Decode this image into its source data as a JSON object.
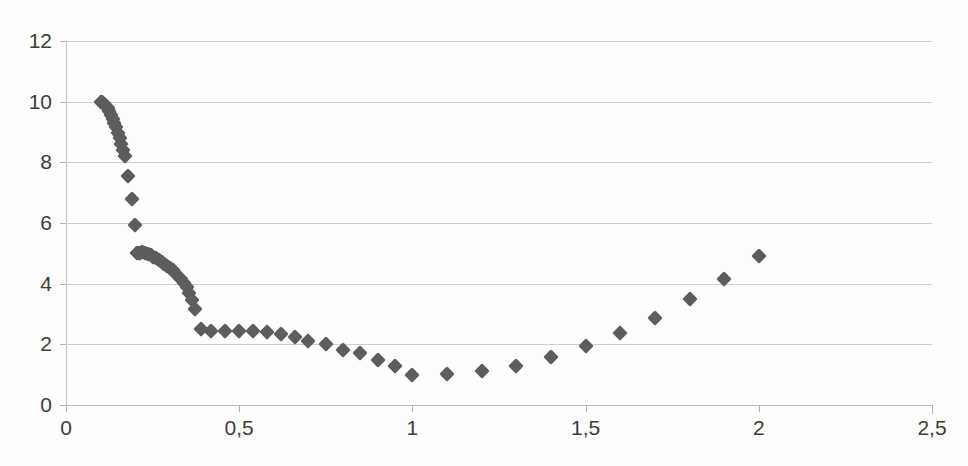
{
  "chart_data": {
    "type": "scatter",
    "title": "",
    "xlabel": "",
    "ylabel": "",
    "xlim": [
      0,
      2.5
    ],
    "ylim": [
      0,
      12
    ],
    "grid": true,
    "legend": null,
    "marker": {
      "shape": "diamond",
      "color": "#5d5d5d",
      "size": 11
    },
    "decimal_separator": ",",
    "xticks": [
      0,
      0.5,
      1,
      1.5,
      2,
      2.5
    ],
    "xtick_labels": [
      "0",
      "0,5",
      "1",
      "1,5",
      "2",
      "2,5"
    ],
    "yticks": [
      0,
      2,
      4,
      6,
      8,
      10,
      12
    ],
    "ytick_labels": [
      "0",
      "2",
      "4",
      "6",
      "8",
      "10",
      "12"
    ],
    "series": [
      {
        "name": "series-1",
        "points": [
          [
            0.1,
            10.0
          ],
          [
            0.105,
            9.98
          ],
          [
            0.11,
            9.92
          ],
          [
            0.115,
            9.85
          ],
          [
            0.12,
            9.78
          ],
          [
            0.125,
            9.68
          ],
          [
            0.13,
            9.55
          ],
          [
            0.135,
            9.44
          ],
          [
            0.14,
            9.3
          ],
          [
            0.145,
            9.15
          ],
          [
            0.15,
            8.98
          ],
          [
            0.155,
            8.8
          ],
          [
            0.16,
            8.62
          ],
          [
            0.165,
            8.4
          ],
          [
            0.17,
            8.2
          ],
          [
            0.18,
            7.55
          ],
          [
            0.19,
            6.8
          ],
          [
            0.2,
            5.95
          ],
          [
            0.205,
            5.02
          ],
          [
            0.21,
            5.0
          ],
          [
            0.215,
            5.01
          ],
          [
            0.22,
            5.03
          ],
          [
            0.228,
            5.0
          ],
          [
            0.236,
            4.97
          ],
          [
            0.244,
            4.93
          ],
          [
            0.252,
            4.88
          ],
          [
            0.26,
            4.83
          ],
          [
            0.268,
            4.78
          ],
          [
            0.276,
            4.72
          ],
          [
            0.284,
            4.66
          ],
          [
            0.292,
            4.59
          ],
          [
            0.3,
            4.52
          ],
          [
            0.308,
            4.44
          ],
          [
            0.316,
            4.35
          ],
          [
            0.324,
            4.25
          ],
          [
            0.332,
            4.14
          ],
          [
            0.34,
            4.02
          ],
          [
            0.348,
            3.88
          ],
          [
            0.356,
            3.7
          ],
          [
            0.364,
            3.45
          ],
          [
            0.372,
            3.15
          ],
          [
            0.39,
            2.5
          ],
          [
            0.42,
            2.45
          ],
          [
            0.46,
            2.45
          ],
          [
            0.5,
            2.45
          ],
          [
            0.54,
            2.44
          ],
          [
            0.58,
            2.4
          ],
          [
            0.62,
            2.35
          ],
          [
            0.66,
            2.25
          ],
          [
            0.7,
            2.12
          ],
          [
            0.75,
            2.0
          ],
          [
            0.8,
            1.8
          ],
          [
            0.85,
            1.7
          ],
          [
            0.9,
            1.48
          ],
          [
            0.95,
            1.3
          ],
          [
            1.0,
            1.0
          ],
          [
            1.1,
            1.02
          ],
          [
            1.2,
            1.12
          ],
          [
            1.3,
            1.3
          ],
          [
            1.4,
            1.58
          ],
          [
            1.5,
            1.95
          ],
          [
            1.6,
            2.38
          ],
          [
            1.7,
            2.87
          ],
          [
            1.8,
            3.48
          ],
          [
            1.9,
            4.15
          ],
          [
            2.0,
            4.9
          ]
        ]
      }
    ]
  }
}
